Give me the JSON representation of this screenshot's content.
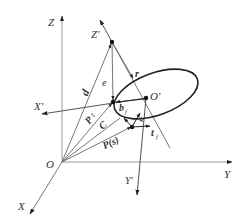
{
  "figure": {
    "labels": {
      "Z": "Z",
      "Z_prime": "Z'",
      "X": "X",
      "X_prime": "X'",
      "Y": "Y",
      "Y_prime": "Y'",
      "O": "O",
      "O_prime": "O'",
      "d": "d",
      "e": "e",
      "r": "r",
      "P1": "P",
      "P1_sub": "1",
      "C": "C",
      "Ps": "P(s)",
      "b": "b",
      "b_sub": "f",
      "n": "n",
      "n_sub": "f",
      "t": "t",
      "t_sub": "f"
    },
    "colors": {
      "axis": "#888888",
      "line": "#555555",
      "ellipse": "#222222",
      "text": "#333333"
    }
  }
}
